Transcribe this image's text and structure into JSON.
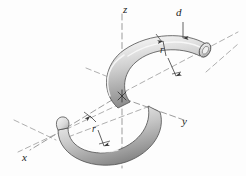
{
  "figure": {
    "kind": "engineering-diagram",
    "background_color": "#fdfdfd",
    "line_color": "#6f6f6f",
    "label_color": "#1c1c1c"
  },
  "axes": {
    "x": {
      "label": "x",
      "left": 22,
      "top": 152
    },
    "y": {
      "label": "y",
      "left": 182,
      "top": 116
    },
    "z": {
      "label": "z",
      "left": 123,
      "top": 4
    }
  },
  "dimensions": {
    "diameter": {
      "label": "d",
      "left": 176,
      "top": 7
    },
    "radius_upper": {
      "label": "r",
      "left": 160,
      "top": 46
    },
    "radius_lower": {
      "label": "r",
      "left": 92,
      "top": 125
    }
  },
  "tube": {
    "fill_light": "#f2f2f2",
    "fill_mid": "#c8c8c8",
    "fill_dark": "#8f8f8f",
    "outline": "#4a4a4a"
  }
}
